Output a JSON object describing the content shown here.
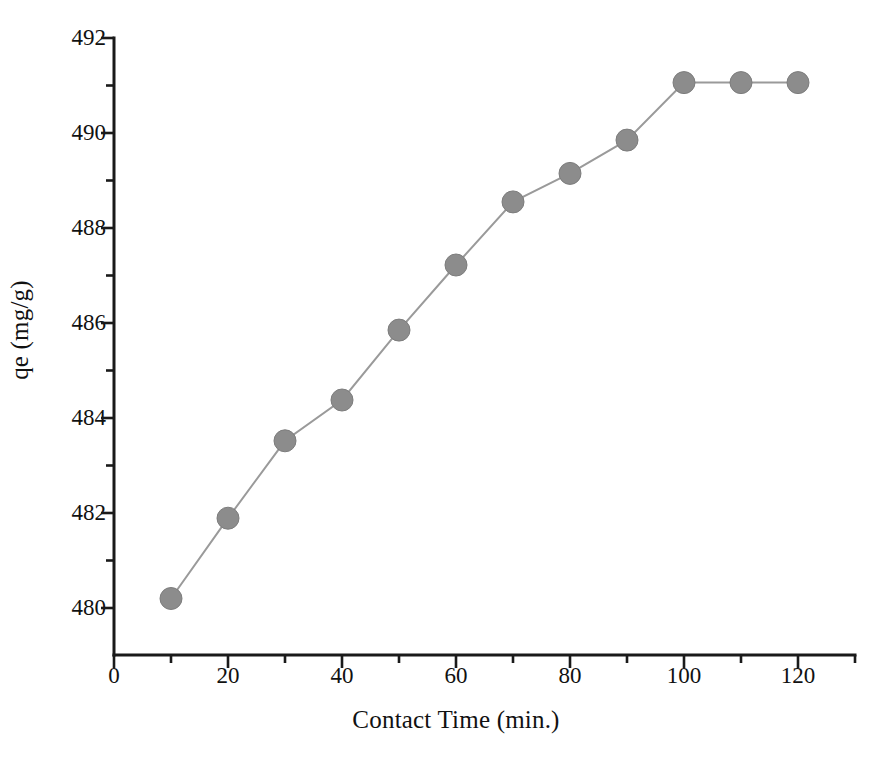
{
  "chart_data": {
    "type": "line",
    "title": "",
    "xlabel": "Contact Time (min.)",
    "ylabel": "qe (mg/g)",
    "xlim": [
      0,
      130
    ],
    "ylim": [
      479,
      492
    ],
    "xticks": [
      0,
      20,
      40,
      60,
      80,
      100,
      120
    ],
    "xtick_labels": [
      "0",
      "20",
      "40",
      "60",
      "80",
      "100",
      "120"
    ],
    "x_minor_ticks": [
      10,
      30,
      50,
      70,
      90,
      110,
      130
    ],
    "yticks": [
      480,
      482,
      484,
      486,
      488,
      490,
      492
    ],
    "ytick_labels": [
      "480",
      "482",
      "484",
      "486",
      "488",
      "490",
      "492"
    ],
    "y_minor_ticks": [
      481,
      483,
      485,
      487,
      489,
      491
    ],
    "grid": false,
    "legend": false,
    "x": [
      10,
      20,
      30,
      40,
      50,
      60,
      70,
      80,
      90,
      100,
      110,
      120
    ],
    "values": [
      480.2,
      481.89,
      483.52,
      484.38,
      485.85,
      487.22,
      488.55,
      489.15,
      489.85,
      491.06,
      491.06,
      491.06
    ],
    "series": [
      {
        "name": "qe",
        "values": [
          480.2,
          481.89,
          483.52,
          484.38,
          485.85,
          487.22,
          488.55,
          489.15,
          489.85,
          491.06,
          491.06,
          491.06
        ]
      }
    ],
    "marker": "filled-circle",
    "marker_color": "#8c8c8c",
    "line_color": "#9a9a9a",
    "axis_color": "#1a1a1a",
    "background_color": "#ffffff"
  }
}
